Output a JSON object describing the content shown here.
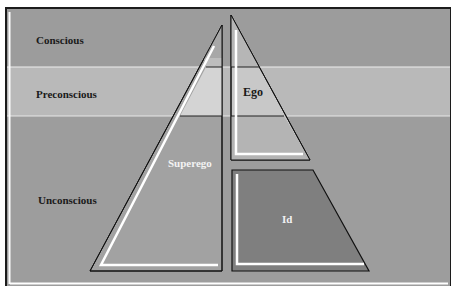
{
  "levels": [
    {
      "id": "conscious",
      "label": "Conscious",
      "color": "#9c9c9c"
    },
    {
      "id": "preconscious",
      "label": "Preconscious",
      "color": "#b9b9b9"
    },
    {
      "id": "unconscious",
      "label": "Unconscious",
      "color": "#9d9d9d"
    }
  ],
  "structures": [
    {
      "id": "superego",
      "label": "Superego",
      "color": "#a0a0a0"
    },
    {
      "id": "ego",
      "label": "Ego",
      "color": "#c9c9c9"
    },
    {
      "id": "id",
      "label": "Id",
      "color": "#7f7f7f"
    }
  ],
  "colors": {
    "frame": "#1c1c1c",
    "highlight": "#ffffff",
    "page": "#ffffff"
  }
}
